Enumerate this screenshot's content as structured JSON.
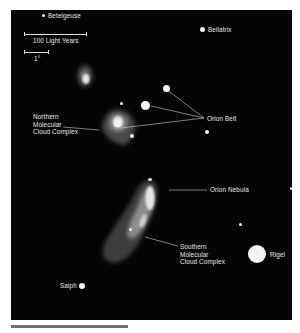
{
  "figure": {
    "background_color": "#050505",
    "nebula_color": "#9a9a9a",
    "star_color": "#f4f4f4"
  },
  "scale": {
    "distance_label": "100 Light Years",
    "angle_label": "1°"
  },
  "stars": {
    "betelgeuse": "Betelgeuse",
    "bellatrix": "Bellatrix",
    "rigel": "Rigel",
    "saiph": "Saiph"
  },
  "annotations": {
    "orion_belt": "Orion Belt",
    "orion_nebula": "Orion Nebula",
    "northern_cloud": "Northern\nMolecular\nCloud Complex",
    "southern_cloud": "Southern\nMolecular\nCloud Complex"
  }
}
